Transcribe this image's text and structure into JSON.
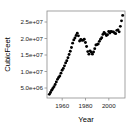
{
  "chart_data": {
    "type": "scatter",
    "title": "",
    "xlabel": "Year",
    "ylabel": "CubicFeet",
    "xlim": [
      1947,
      2014
    ],
    "ylim": [
      4200000,
      28000000
    ],
    "grid": false,
    "legend": false,
    "marker": "filled-circle",
    "marker_color": "#000000",
    "xticks": [
      1960,
      1980,
      2000
    ],
    "xticklabels": [
      "1960",
      "1980",
      "2000"
    ],
    "yticks": [
      5000000,
      10000000,
      15000000,
      20000000,
      25000000
    ],
    "yticklabels": [
      "5.0e+06",
      "1.0e+07",
      "1.5e+07",
      "2.0e+07",
      "2.5e+07"
    ],
    "x": [
      1949,
      1950,
      1951,
      1952,
      1953,
      1954,
      1955,
      1956,
      1957,
      1958,
      1959,
      1960,
      1961,
      1962,
      1963,
      1964,
      1965,
      1966,
      1967,
      1968,
      1969,
      1970,
      1971,
      1972,
      1973,
      1974,
      1975,
      1976,
      1977,
      1978,
      1979,
      1980,
      1981,
      1982,
      1983,
      1984,
      1985,
      1986,
      1987,
      1988,
      1989,
      1990,
      1991,
      1992,
      1993,
      1994,
      1995,
      1996,
      1997,
      1998,
      1999,
      2000,
      2001,
      2002,
      2003,
      2004,
      2005,
      2006,
      2007,
      2008,
      2009,
      2010,
      2011,
      2012
    ],
    "y": [
      5200000,
      5700000,
      6300000,
      6800000,
      7300000,
      7900000,
      8600000,
      9300000,
      9800000,
      10200000,
      11000000,
      11800000,
      12300000,
      13000000,
      13800000,
      14400000,
      15200000,
      16100000,
      17000000,
      18000000,
      19200000,
      20100000,
      20600000,
      21300000,
      21900000,
      21200000,
      19800000,
      20200000,
      20000000,
      20000000,
      20300000,
      19400000,
      18300000,
      16900000,
      16200000,
      17100000,
      16700000,
      16200000,
      16800000,
      17700000,
      18700000,
      18800000,
      19000000,
      19700000,
      20300000,
      20700000,
      21600000,
      22100000,
      21800000,
      21300000,
      21500000,
      22400000,
      22000000,
      22400000,
      22300000,
      22300000,
      22000000,
      21800000,
      22700000,
      22800000,
      22300000,
      23800000,
      25300000,
      26800000
    ]
  },
  "axes": {
    "y_axis_title": "CubicFeet",
    "x_axis_title": "Year",
    "y_tick_labels": [
      "2.5e+07",
      "2.0e+07",
      "1.5e+07",
      "1.0e+07",
      "5.0e+06"
    ],
    "x_tick_labels": [
      "1960",
      "1980",
      "2000"
    ]
  }
}
